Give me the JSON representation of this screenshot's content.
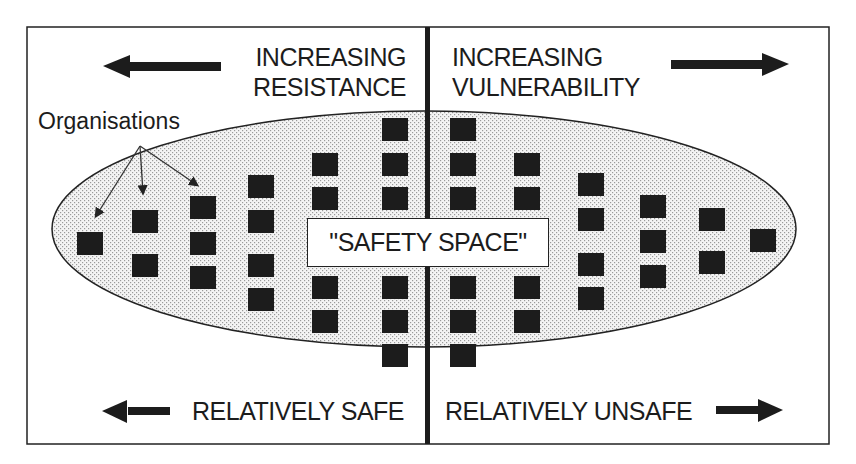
{
  "diagram": {
    "title": "",
    "top_left_label": {
      "line1": "INCREASING",
      "line2": "RESISTANCE",
      "arrow": "left-arrow-icon"
    },
    "top_right_label": {
      "line1": "INCREASING",
      "line2": "VULNERABILITY",
      "arrow": "right-arrow-icon"
    },
    "bottom_left_label": {
      "text": "RELATIVELY SAFE",
      "arrow": "left-arrow-icon"
    },
    "bottom_right_label": {
      "text": "RELATIVELY UNSAFE",
      "arrow": "right-arrow-icon"
    },
    "organisations_label": "Organisations",
    "center_label": "\"SAFETY SPACE\"",
    "colors": {
      "ink": "#1c1c1c",
      "stipple": "#c8c8c8",
      "background": "#ffffff"
    },
    "columns": [
      {
        "x": 77,
        "squares_y": [
          232
        ]
      },
      {
        "x": 132,
        "squares_y": [
          210,
          254
        ]
      },
      {
        "x": 190,
        "squares_y": [
          196,
          232,
          266
        ]
      },
      {
        "x": 248,
        "squares_y": [
          175,
          210,
          254,
          288
        ]
      },
      {
        "x": 312,
        "squares_y": [
          153,
          187,
          276,
          310
        ]
      },
      {
        "x": 382,
        "squares_y": [
          118,
          153,
          187,
          276,
          310,
          344
        ]
      },
      {
        "x": 450,
        "squares_y": [
          118,
          153,
          187,
          276,
          310,
          344
        ]
      },
      {
        "x": 514,
        "squares_y": [
          153,
          187,
          276,
          310
        ]
      },
      {
        "x": 578,
        "squares_y": [
          173,
          208,
          253,
          287
        ]
      },
      {
        "x": 640,
        "squares_y": [
          195,
          230,
          265
        ]
      },
      {
        "x": 699,
        "squares_y": [
          208,
          251
        ]
      },
      {
        "x": 750,
        "squares_y": [
          229
        ]
      }
    ]
  }
}
